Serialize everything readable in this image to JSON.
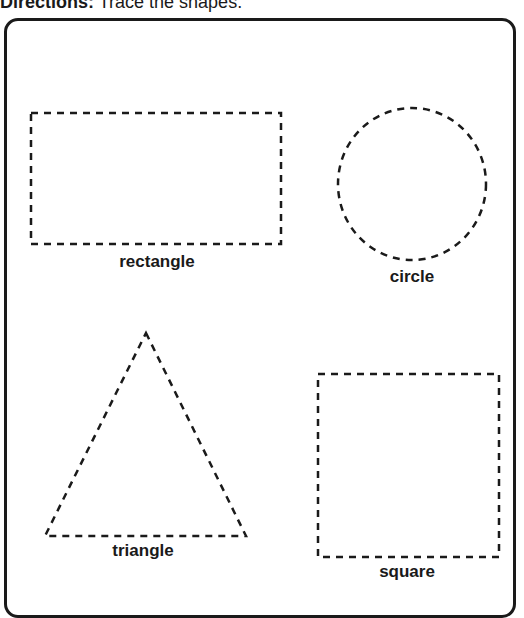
{
  "header": {
    "directions_label": "Directions:",
    "directions_text": "Trace the shapes."
  },
  "shapes": [
    {
      "name": "rectangle",
      "label": "rectangle",
      "style": "dashed"
    },
    {
      "name": "circle",
      "label": "circle",
      "style": "dashed"
    },
    {
      "name": "triangle",
      "label": "triangle",
      "style": "dashed"
    },
    {
      "name": "square",
      "label": "square",
      "style": "dashed"
    }
  ],
  "colors": {
    "ink": "#1a1a1a",
    "background": "#ffffff"
  }
}
